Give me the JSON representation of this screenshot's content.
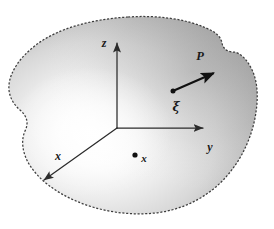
{
  "figure": {
    "background_color": "#ffffff",
    "width": 274,
    "height": 229
  },
  "body_region": {
    "name": "continuum-body",
    "outline_style": "dashed",
    "outline_color": "#3f3f3f",
    "fill_description": "radial grayscale gradient, light center to gray edge",
    "fill_center_color": "#ffffff",
    "fill_edge_color": "#9a9a9a",
    "fill_outer_color": "#8c8c8c"
  },
  "axes": {
    "origin_label": "",
    "stroke_color": "#2b2b2b",
    "items": [
      {
        "id": "z",
        "label": "z",
        "direction": "up",
        "label_x": 104,
        "label_y": 44
      },
      {
        "id": "y",
        "label": "y",
        "direction": "right",
        "label_x": 210,
        "label_y": 148
      },
      {
        "id": "x",
        "label": "x",
        "direction": "down-left",
        "label_x": 58,
        "label_y": 157
      }
    ]
  },
  "points": [
    {
      "id": "material-point-x",
      "label": "x",
      "label_style": "bold-italic",
      "dot_x": 135,
      "dot_y": 155,
      "label_x": 144,
      "label_y": 159
    },
    {
      "id": "vector-tail-xi",
      "label": "ξ",
      "label_style": "bold-italic-greek",
      "dot_x": 173,
      "dot_y": 91,
      "label_x": 176,
      "label_y": 107
    }
  ],
  "vectors": [
    {
      "id": "traction-vector-P",
      "label": "P",
      "label_style": "bold-italic",
      "from_x": 173,
      "from_y": 91,
      "to_x": 216,
      "to_y": 72,
      "label_x": 200,
      "label_y": 57,
      "stroke_color": "#111111",
      "stroke_width": 2.2
    }
  ]
}
